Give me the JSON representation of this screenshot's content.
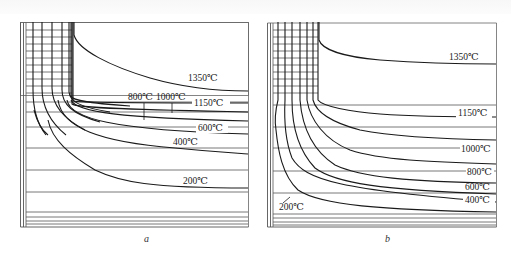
{
  "figure": {
    "panels": [
      {
        "id": "a",
        "caption": "a",
        "isotherms": [
          {
            "label": "1350℃",
            "label_pos": [
              208,
              80
            ]
          },
          {
            "label": "1150℃",
            "label_pos": [
              209,
              106
            ]
          },
          {
            "label": "1000℃",
            "label_pos": [
              158,
              99
            ]
          },
          {
            "label": "800℃",
            "label_pos": [
              129,
              99
            ]
          },
          {
            "label": "600℃",
            "label_pos": [
              200,
              131
            ]
          },
          {
            "label": "400℃",
            "label_pos": [
              174,
              145
            ]
          },
          {
            "label": "200℃",
            "label_pos": [
              184,
              183
            ]
          }
        ]
      },
      {
        "id": "b",
        "caption": "b",
        "isotherms": [
          {
            "label": "1350℃",
            "label_pos": [
              450,
              59
            ]
          },
          {
            "label": "1150℃",
            "label_pos": [
              458,
              115
            ]
          },
          {
            "label": "1000℃",
            "label_pos": [
              462,
              152
            ]
          },
          {
            "label": "800℃",
            "label_pos": [
              468,
              175
            ]
          },
          {
            "label": "600℃",
            "label_pos": [
              465,
              192
            ]
          },
          {
            "label": "400℃",
            "label_pos": [
              465,
              203
            ]
          },
          {
            "label": "200℃",
            "label_pos": [
              280,
              209
            ]
          }
        ]
      }
    ],
    "colors": {
      "line": "#1a1a1a",
      "grid": "#555555",
      "background": "#ffffff"
    }
  }
}
